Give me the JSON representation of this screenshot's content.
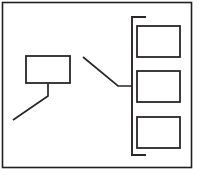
{
  "figure": {
    "background_color": "#ffffff",
    "stroke_color": "#2a2628",
    "frame_color": "#231f20",
    "width": 201,
    "height": 175
  },
  "frame": {
    "name": "outer-border",
    "x": 2.5,
    "y": 2.5,
    "width": 189,
    "height": 165
  },
  "left_block": {
    "name": "left-rectangle",
    "x": 26,
    "y": 56,
    "width": 44,
    "height": 27,
    "leader": {
      "name": "left-leader-line",
      "points": "48,83 48,96 13,120"
    }
  },
  "center_connector": {
    "name": "center-connector-line",
    "points": "83,57 118,86 132,86"
  },
  "bracket": {
    "name": "right-bracket",
    "points": "146,17 132,17 132,155 146,155"
  },
  "right_boxes": [
    {
      "name": "right-box-top",
      "x": 137,
      "y": 26,
      "width": 43,
      "height": 31
    },
    {
      "name": "right-box-middle",
      "x": 137,
      "y": 71,
      "width": 43,
      "height": 31
    },
    {
      "name": "right-box-bottom",
      "x": 137,
      "y": 117,
      "width": 43,
      "height": 31
    }
  ]
}
